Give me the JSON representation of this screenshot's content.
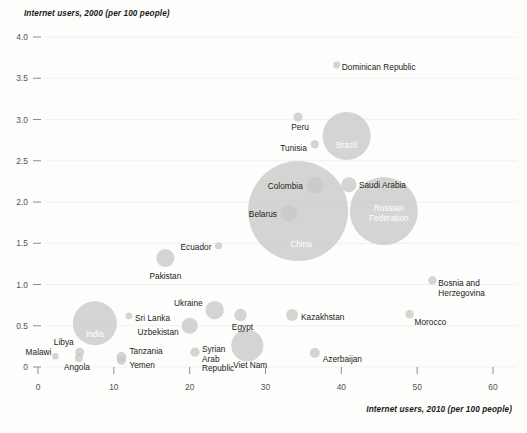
{
  "chart_data": {
    "type": "scatter",
    "title": "",
    "xlabel": "Internet users, 2010 (per 100 people)",
    "ylabel": "Internet users, 2000 (per 100 people)",
    "xlim": [
      0,
      60
    ],
    "ylim": [
      0,
      4.0
    ],
    "xticks": [
      0,
      10,
      20,
      30,
      40,
      50,
      60
    ],
    "xtick_labels": [
      "0",
      "10",
      "20",
      "30",
      "40",
      "50",
      "60"
    ],
    "yticks": [
      0,
      0.5,
      1.0,
      1.5,
      2.0,
      2.5,
      3.0,
      3.5,
      4.0
    ],
    "ytick_labels": [
      "0",
      "0.5",
      "1.0",
      "1.5",
      "2.0",
      "2.5",
      "3.0",
      "3.5",
      "4.0"
    ],
    "grid": true,
    "legend": "none",
    "bubble_fill": "#c9c8c6",
    "bubble_label_inside_color": "#ffffff",
    "bubble_label_outside_color": "#242322",
    "background": "#fdfdfc",
    "size_encoding": "population",
    "points": [
      {
        "name": "Malawi",
        "x": 2.3,
        "y": 0.13,
        "r": 3.2,
        "label_pos": "left",
        "label_dx": -4,
        "label_dy": -1,
        "inside": false
      },
      {
        "name": "Libya",
        "x": 5.5,
        "y": 0.18,
        "r": 4.5,
        "label_pos": "upleft",
        "label_dx": -6,
        "label_dy": -7,
        "inside": false
      },
      {
        "name": "Angola",
        "x": 5.4,
        "y": 0.11,
        "r": 4.2,
        "label_pos": "below",
        "label_dx": -2,
        "label_dy": 12,
        "inside": false
      },
      {
        "name": "India",
        "x": 7.5,
        "y": 0.53,
        "r": 22.0,
        "label_pos": "center",
        "label_dx": 0,
        "label_dy": 14,
        "inside": true
      },
      {
        "name": "Tanzania",
        "x": 11.0,
        "y": 0.12,
        "r": 5.0,
        "label_pos": "right",
        "label_dx": 8,
        "label_dy": -3,
        "inside": false
      },
      {
        "name": "Yemen",
        "x": 11.0,
        "y": 0.08,
        "r": 4.4,
        "label_pos": "right",
        "label_dx": 8,
        "label_dy": 8,
        "inside": false
      },
      {
        "name": "Sri Lanka",
        "x": 12.0,
        "y": 0.62,
        "r": 3.4,
        "label_pos": "right",
        "label_dx": 6,
        "label_dy": 5,
        "inside": false
      },
      {
        "name": "Pakistan",
        "x": 16.8,
        "y": 1.32,
        "r": 9.0,
        "label_pos": "below",
        "label_dx": 0,
        "label_dy": 21,
        "inside": false
      },
      {
        "name": "Uzbekistan",
        "x": 20.0,
        "y": 0.5,
        "r": 8.0,
        "label_pos": "left",
        "label_dx": -11,
        "label_dy": 9,
        "inside": false
      },
      {
        "name": "Syrian Arab Republic",
        "x": 20.7,
        "y": 0.18,
        "r": 4.6,
        "label_pos": "right",
        "label_dx": 7,
        "label_dy": 0,
        "inside": false
      },
      {
        "name": "Ukraine",
        "x": 23.3,
        "y": 0.69,
        "r": 9.2,
        "label_pos": "left",
        "label_dx": -12,
        "label_dy": -4,
        "inside": false
      },
      {
        "name": "Ecuador",
        "x": 23.8,
        "y": 1.47,
        "r": 3.6,
        "label_pos": "left",
        "label_dx": -7,
        "label_dy": 4,
        "inside": false
      },
      {
        "name": "Egypt",
        "x": 26.7,
        "y": 0.63,
        "r": 6.2,
        "label_pos": "below",
        "label_dx": 2,
        "label_dy": 15,
        "inside": false
      },
      {
        "name": "Viet Nam",
        "x": 27.6,
        "y": 0.26,
        "r": 16.0,
        "label_pos": "below",
        "label_dx": 3,
        "label_dy": 22,
        "inside": false
      },
      {
        "name": "Colombia",
        "x": 36.5,
        "y": 2.2,
        "r": 8.5,
        "label_pos": "left",
        "label_dx": -12,
        "label_dy": 3,
        "inside": false
      },
      {
        "name": "Belarus",
        "x": 33.1,
        "y": 1.86,
        "r": 8.2,
        "label_pos": "left",
        "label_dx": -12,
        "label_dy": 3,
        "inside": false
      },
      {
        "name": "China",
        "x": 34.3,
        "y": 1.89,
        "r": 50.0,
        "label_pos": "center",
        "label_dx": 3,
        "label_dy": 36,
        "inside": true
      },
      {
        "name": "Saudi Arabia",
        "x": 41.0,
        "y": 2.21,
        "r": 7.5,
        "label_pos": "right",
        "label_dx": 10,
        "label_dy": 3,
        "inside": false
      },
      {
        "name": "Russian Federation",
        "x": 45.6,
        "y": 1.89,
        "r": 34.0,
        "label_pos": "center",
        "label_dx": 5,
        "label_dy": 0,
        "inside": true
      },
      {
        "name": "Kazakhstan",
        "x": 33.5,
        "y": 0.63,
        "r": 6.0,
        "label_pos": "right",
        "label_dx": 9,
        "label_dy": 5,
        "inside": false
      },
      {
        "name": "Azerbaijan",
        "x": 36.5,
        "y": 0.17,
        "r": 5.0,
        "label_pos": "right",
        "label_dx": 8,
        "label_dy": 9,
        "inside": false
      },
      {
        "name": "Tunisia",
        "x": 36.5,
        "y": 2.7,
        "r": 4.2,
        "label_pos": "left",
        "label_dx": -8,
        "label_dy": 7,
        "inside": false
      },
      {
        "name": "Peru",
        "x": 34.3,
        "y": 3.03,
        "r": 4.6,
        "label_pos": "below",
        "label_dx": 2,
        "label_dy": 13,
        "inside": false
      },
      {
        "name": "Brazil",
        "x": 40.7,
        "y": 2.8,
        "r": 24.0,
        "label_pos": "center",
        "label_dx": 0,
        "label_dy": 12,
        "inside": true
      },
      {
        "name": "Dominican Republic",
        "x": 39.4,
        "y": 3.66,
        "r": 3.6,
        "label_pos": "right",
        "label_dx": 5,
        "label_dy": 5,
        "inside": false
      },
      {
        "name": "Bosnia and Herzegovina",
        "x": 52.0,
        "y": 1.05,
        "r": 4.2,
        "label_pos": "right",
        "label_dx": 6,
        "label_dy": 6,
        "inside": false
      },
      {
        "name": "Morocco",
        "x": 49.0,
        "y": 0.64,
        "r": 4.2,
        "label_pos": "right",
        "label_dx": 5,
        "label_dy": 11,
        "inside": false
      }
    ]
  },
  "axes": {
    "x_title": "Internet users, 2010 (per 100 people)",
    "y_title": "Internet users, 2000 (per 100 people)"
  },
  "labels": {
    "bosnia_line1": "Bosnia and",
    "bosnia_line2": "Herzegovina",
    "syria_line1": "Syrian",
    "syria_line2": "Arab",
    "syria_line3": "Republic",
    "russia_line1": "Russian",
    "russia_line2": "Federation"
  }
}
